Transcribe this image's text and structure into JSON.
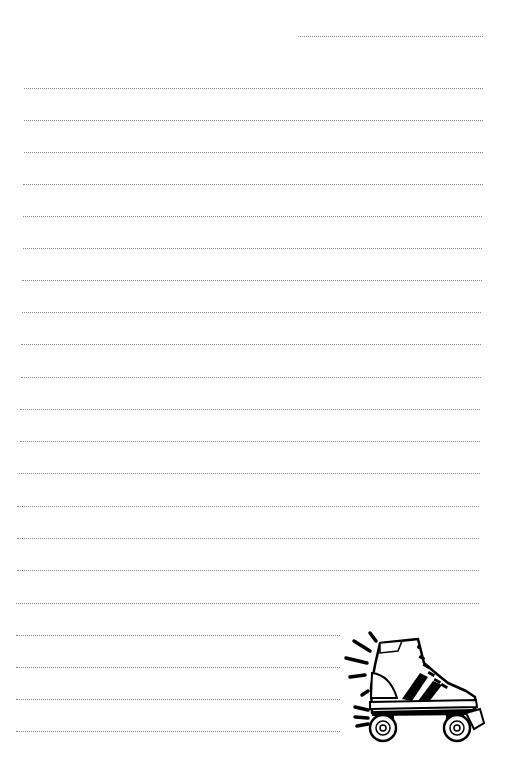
{
  "page": {
    "type": "lined-notepaper",
    "background": "#ffffff",
    "line_color": "#8a8a8a",
    "line_style": "dotted"
  },
  "header_line": {
    "x1": 298,
    "x2": 483,
    "y": 36
  },
  "lines": [
    {
      "x1": 24,
      "x2": 483,
      "y": 88
    },
    {
      "x1": 24,
      "x2": 483,
      "y": 120
    },
    {
      "x1": 24,
      "x2": 483,
      "y": 152
    },
    {
      "x1": 23,
      "x2": 483,
      "y": 184
    },
    {
      "x1": 23,
      "x2": 482,
      "y": 216
    },
    {
      "x1": 23,
      "x2": 482,
      "y": 248
    },
    {
      "x1": 22,
      "x2": 482,
      "y": 280
    },
    {
      "x1": 22,
      "x2": 481,
      "y": 312
    },
    {
      "x1": 21,
      "x2": 481,
      "y": 344
    },
    {
      "x1": 21,
      "x2": 481,
      "y": 377
    },
    {
      "x1": 20,
      "x2": 480,
      "y": 409
    },
    {
      "x1": 20,
      "x2": 480,
      "y": 441
    },
    {
      "x1": 19,
      "x2": 480,
      "y": 473
    },
    {
      "x1": 17,
      "x2": 479,
      "y": 506
    },
    {
      "x1": 17,
      "x2": 479,
      "y": 538
    },
    {
      "x1": 17,
      "x2": 479,
      "y": 570
    },
    {
      "x1": 16,
      "x2": 479,
      "y": 603
    },
    {
      "x1": 16,
      "x2": 478,
      "y": 635
    },
    {
      "x1": 16,
      "x2": 478,
      "y": 667
    },
    {
      "x1": 16,
      "x2": 478,
      "y": 699
    },
    {
      "x1": 16,
      "x2": 478,
      "y": 731
    }
  ],
  "illustration": {
    "name": "roller-skate-icon",
    "position": "bottom-right"
  }
}
